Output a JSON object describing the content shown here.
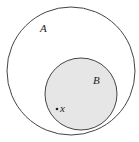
{
  "diagram": {
    "type": "venn-subset",
    "sets": [
      {
        "label": "A",
        "fill": "#ffffff",
        "stroke": "#444444"
      },
      {
        "label": "B",
        "fill": "#e6e6e6",
        "stroke": "#444444"
      }
    ],
    "point": {
      "label": "x",
      "in_set": "B"
    }
  }
}
